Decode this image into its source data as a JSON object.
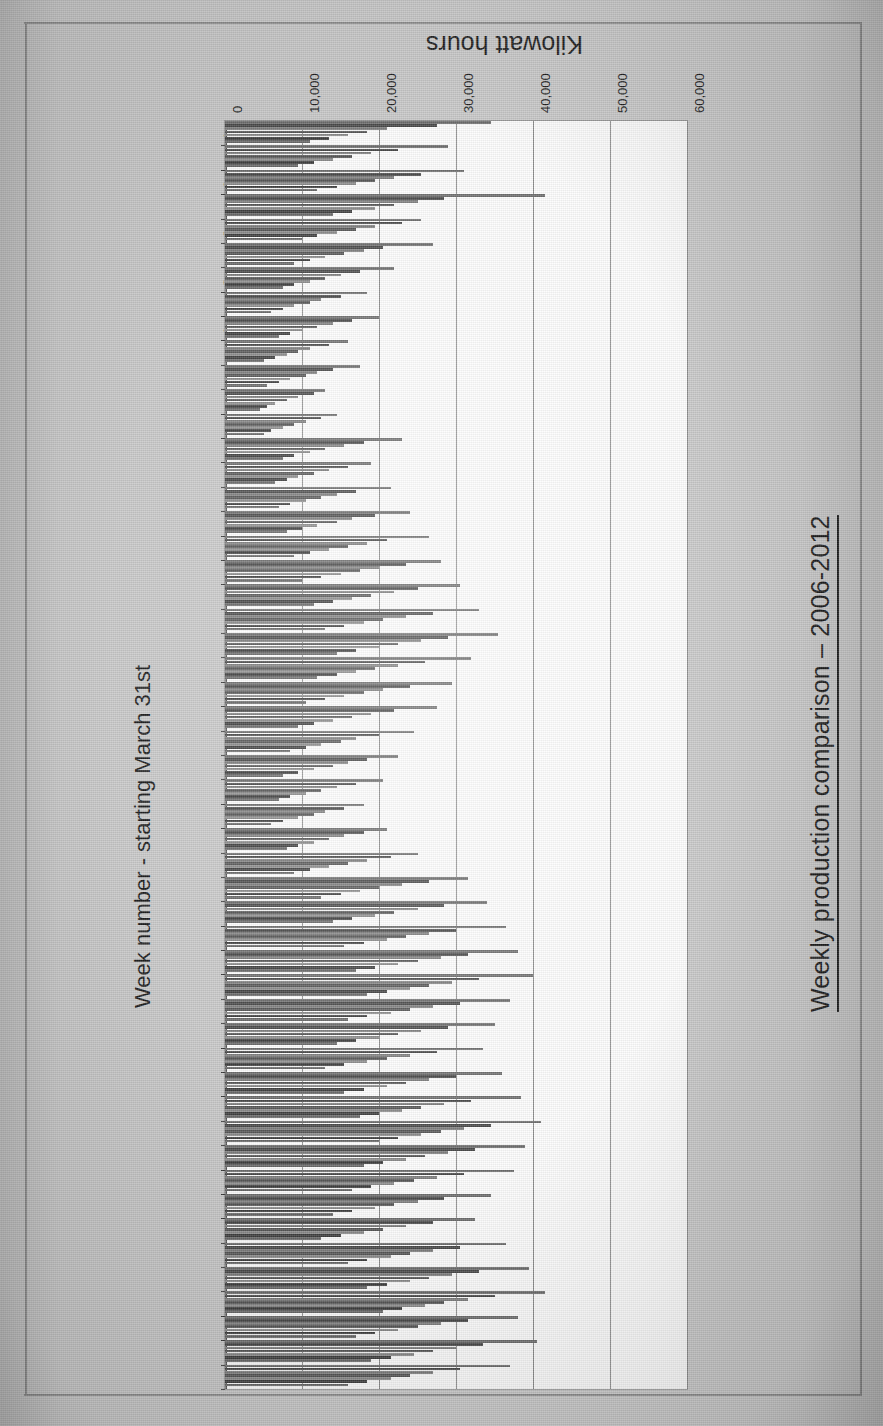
{
  "document": {
    "kind": "scanned-chart-page",
    "background_color": "#c9c9c9",
    "plot_background_color": "#fdfdfd"
  },
  "chart_title": "Weekly production comparison – 2006-2012",
  "value_axis": {
    "title": "Kilowatt hours",
    "ticks": [
      "0",
      "10,000",
      "20,000",
      "30,000",
      "40,000",
      "50,000",
      "60,000"
    ],
    "min": 0,
    "max": 60000,
    "grid": true
  },
  "category_axis": {
    "title": "Week number - starting March 31st",
    "labels": [
      "1",
      "2",
      "3",
      "4",
      "5",
      "6",
      "7",
      "8",
      "9",
      "10",
      "11",
      "12",
      "13",
      "14",
      "15",
      "16",
      "17",
      "18",
      "19",
      "20",
      "21",
      "22",
      "23",
      "24",
      "25",
      "26",
      "27",
      "28",
      "29",
      "30",
      "31",
      "32",
      "33",
      "34",
      "35",
      "36",
      "37",
      "38",
      "39",
      "40",
      "41",
      "42",
      "43",
      "44",
      "45",
      "46",
      "47",
      "48",
      "49",
      "50",
      "51",
      "52"
    ],
    "label_every": 2
  },
  "series_colors": [
    "#6e6e6e",
    "#4a4a4a",
    "#7f7f7f",
    "#585858",
    "#8c8c8c",
    "#3f3f3f",
    "#6a6a6a"
  ],
  "chart_data": {
    "type": "bar",
    "orientation": "horizontal",
    "title": "Weekly production comparison – 2006-2012",
    "xlabel": "Kilowatt hours",
    "ylabel": "Week number - starting March 31st",
    "xlim": [
      0,
      60000
    ],
    "grid": true,
    "legend": "none",
    "categories": [
      "1",
      "2",
      "3",
      "4",
      "5",
      "6",
      "7",
      "8",
      "9",
      "10",
      "11",
      "12",
      "13",
      "14",
      "15",
      "16",
      "17",
      "18",
      "19",
      "20",
      "21",
      "22",
      "23",
      "24",
      "25",
      "26",
      "27",
      "28",
      "29",
      "30",
      "31",
      "32",
      "33",
      "34",
      "35",
      "36",
      "37",
      "38",
      "39",
      "40",
      "41",
      "42",
      "43",
      "44",
      "45",
      "46",
      "47",
      "48",
      "49",
      "50",
      "51",
      "52"
    ],
    "series": [
      {
        "name": "2006",
        "values": [
          34500,
          29000,
          31000,
          41500,
          25500,
          27000,
          22000,
          18500,
          20000,
          16000,
          17500,
          13000,
          14500,
          23000,
          19000,
          21500,
          24000,
          26500,
          28000,
          30500,
          33000,
          35500,
          32000,
          29500,
          27500,
          24500,
          22500,
          20500,
          18000,
          21000,
          25000,
          31500,
          34000,
          36500,
          38000,
          40000,
          37000,
          35000,
          33500,
          36000,
          38500,
          41000,
          39000,
          37500,
          34500,
          32500,
          36500,
          39500,
          41500,
          38000,
          40500,
          37000
        ]
      },
      {
        "name": "2007",
        "values": [
          27500,
          22500,
          25500,
          28500,
          23000,
          20500,
          17500,
          15000,
          16500,
          13500,
          14000,
          11500,
          12500,
          18000,
          16000,
          17000,
          19500,
          21000,
          23500,
          25000,
          27000,
          29000,
          26000,
          24000,
          22000,
          20000,
          18500,
          17000,
          15500,
          18000,
          21500,
          26500,
          28500,
          30000,
          31500,
          33000,
          30500,
          29000,
          27500,
          30000,
          32000,
          34500,
          32500,
          31000,
          28500,
          27000,
          30500,
          33000,
          35000,
          31500,
          33500,
          30500
        ]
      },
      {
        "name": "2008",
        "values": [
          21000,
          19000,
          22000,
          25000,
          19500,
          18000,
          15000,
          12500,
          14000,
          11000,
          12000,
          9500,
          10500,
          15500,
          13500,
          14500,
          16500,
          18500,
          20000,
          22000,
          23500,
          25500,
          22500,
          20500,
          19000,
          17000,
          16000,
          14500,
          13000,
          15500,
          18500,
          23000,
          25000,
          26500,
          28000,
          29500,
          27000,
          25500,
          24000,
          26500,
          28500,
          31000,
          29000,
          27500,
          25000,
          23500,
          27000,
          29500,
          31500,
          28000,
          30000,
          27000
        ]
      },
      {
        "name": "2009",
        "values": [
          18500,
          16500,
          19500,
          22000,
          17000,
          15500,
          13000,
          11000,
          12000,
          9500,
          10500,
          8000,
          9000,
          13000,
          11500,
          12500,
          14500,
          16000,
          17500,
          19000,
          20500,
          22500,
          19500,
          18000,
          16500,
          15000,
          14000,
          12500,
          11500,
          13500,
          16000,
          20000,
          22000,
          23500,
          25000,
          26500,
          24000,
          22500,
          21000,
          23500,
          25500,
          28000,
          26000,
          24500,
          22000,
          20500,
          24000,
          26500,
          28500,
          25000,
          27000,
          24000
        ]
      },
      {
        "name": "2010",
        "values": [
          16000,
          14000,
          17000,
          19500,
          14500,
          13000,
          11000,
          9000,
          10000,
          8000,
          8500,
          6500,
          7500,
          11000,
          9500,
          10500,
          12000,
          13500,
          15000,
          16500,
          18000,
          20000,
          17000,
          15500,
          14000,
          12500,
          11500,
          10500,
          9500,
          11500,
          13500,
          17500,
          19500,
          21000,
          22500,
          24000,
          21500,
          20000,
          18500,
          21000,
          23000,
          25500,
          23500,
          22000,
          19500,
          18000,
          21500,
          24000,
          26000,
          22500,
          24500,
          21500
        ]
      },
      {
        "name": "2011",
        "values": [
          13500,
          11500,
          14500,
          16500,
          12000,
          11000,
          9000,
          7500,
          8500,
          6500,
          7000,
          5500,
          6000,
          9000,
          8000,
          8500,
          10000,
          11000,
          12500,
          14000,
          15500,
          17000,
          14500,
          13000,
          11500,
          10500,
          9500,
          8500,
          7500,
          9500,
          11000,
          15000,
          16500,
          18000,
          19500,
          21000,
          18500,
          17000,
          15500,
          18000,
          20000,
          22500,
          20500,
          19000,
          16500,
          15000,
          18500,
          21000,
          23000,
          19500,
          21500,
          18500
        ]
      },
      {
        "name": "2012",
        "values": [
          11000,
          9500,
          12000,
          14000,
          10000,
          9000,
          7500,
          6000,
          7000,
          5000,
          5500,
          4500,
          5000,
          7500,
          6500,
          7000,
          8000,
          9000,
          10000,
          11500,
          13000,
          14500,
          12000,
          10500,
          9500,
          8500,
          7500,
          7000,
          6000,
          8000,
          9000,
          12500,
          14000,
          15500,
          17000,
          18500,
          16000,
          14500,
          13000,
          15500,
          17500,
          20000,
          18000,
          16500,
          14000,
          12500,
          16000,
          18500,
          20500,
          17000,
          19000,
          16000
        ]
      }
    ]
  }
}
